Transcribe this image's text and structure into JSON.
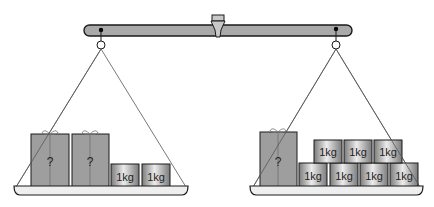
{
  "diagram": {
    "colors": {
      "beam": "#a9a9a9",
      "outline": "#1a1a1a",
      "box": "#9e9e9e",
      "weight_light": "#e8e8e8",
      "weight_dark": "#7a7a7a",
      "pan": "#efefef",
      "string": "#555555"
    },
    "left_pan": {
      "mystery_boxes": [
        {
          "label": "?"
        },
        {
          "label": "?"
        }
      ],
      "weights": [
        {
          "label": "1kg"
        },
        {
          "label": "1kg"
        }
      ]
    },
    "right_pan": {
      "mystery_boxes": [
        {
          "label": "?"
        }
      ],
      "weights_bottom": [
        {
          "label": "1kg"
        },
        {
          "label": "1kg"
        },
        {
          "label": "1kg"
        },
        {
          "label": "1kg"
        }
      ],
      "weights_top": [
        {
          "label": "1kg"
        },
        {
          "label": "1kg"
        },
        {
          "label": "1kg"
        }
      ]
    }
  }
}
